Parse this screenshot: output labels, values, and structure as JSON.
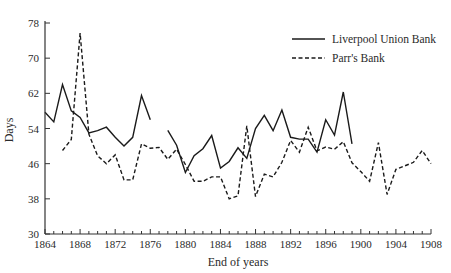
{
  "chart_data": {
    "type": "line",
    "title": "",
    "xlabel": "End of years",
    "ylabel": "Days",
    "xlim": [
      1864,
      1908
    ],
    "ylim": [
      30,
      78
    ],
    "x_ticks": [
      1864,
      1868,
      1872,
      1876,
      1880,
      1884,
      1888,
      1892,
      1896,
      1900,
      1904,
      1908
    ],
    "y_ticks": [
      30,
      38,
      46,
      54,
      62,
      70,
      78
    ],
    "grid": false,
    "legend_position": "upper right",
    "series": [
      {
        "name": "Liverpool Union Bank",
        "style": "solid",
        "x": [
          1864,
          1865,
          1866,
          1867,
          1868,
          1869,
          1870,
          1871,
          1872,
          1873,
          1874,
          1875,
          1876,
          null,
          1878,
          1879,
          1880,
          1881,
          1882,
          1883,
          1884,
          1885,
          1886,
          1887,
          1888,
          1889,
          1890,
          1891,
          1892,
          1893,
          1894,
          1895,
          1896,
          1897,
          1898,
          1899
        ],
        "values": [
          57.7,
          55.5,
          64,
          58,
          56.5,
          53,
          53.5,
          54.3,
          52,
          50,
          52,
          61.5,
          56,
          null,
          53.6,
          50.2,
          44,
          47.8,
          49.4,
          52.4,
          45,
          46.5,
          49.6,
          47.2,
          54,
          57,
          53.5,
          58.2,
          52,
          51.6,
          51.6,
          48.6,
          56,
          52.5,
          62.3,
          50.5
        ]
      },
      {
        "name": "Parr's Bank",
        "style": "dashed",
        "x": [
          1866,
          1867,
          1868,
          1869,
          1870,
          1871,
          1872,
          1873,
          1874,
          1875,
          1876,
          1877,
          1878,
          1879,
          1880,
          1881,
          1882,
          1883,
          1884,
          1885,
          1886,
          1887,
          1888,
          1889,
          1890,
          1891,
          1892,
          1893,
          1894,
          1895,
          1896,
          1897,
          1898,
          1899,
          1900,
          1901,
          1902,
          1903,
          1904,
          1905,
          1906,
          1907,
          1908
        ],
        "values": [
          49,
          51.5,
          75.7,
          52.7,
          47.8,
          46,
          48,
          42.3,
          42.3,
          50.5,
          49.5,
          49.7,
          47,
          49.3,
          45.8,
          42,
          42,
          43,
          43,
          38,
          38.7,
          54.6,
          38.5,
          43.6,
          43,
          46.3,
          51.3,
          48.6,
          54.3,
          48.9,
          49.8,
          49.3,
          51,
          46.2,
          44.2,
          42,
          50.8,
          39,
          44.7,
          45.5,
          46.3,
          49,
          46
        ]
      }
    ]
  },
  "legend": {
    "items": [
      {
        "label": "Liverpool Union Bank",
        "style": "solid"
      },
      {
        "label": "Parr's Bank",
        "style": "dashed"
      }
    ]
  },
  "colors": {
    "line": "#1a1a1a",
    "axis": "#333333"
  }
}
